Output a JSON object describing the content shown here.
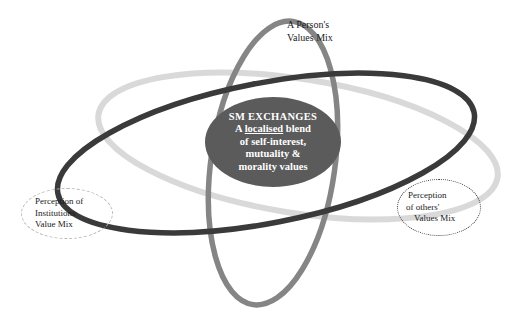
{
  "diagram": {
    "canvas": {
      "width": 520,
      "height": 319,
      "background": "#ffffff"
    },
    "core": {
      "name": "SM EXCHANGES",
      "heading": "SM EXCHANGES",
      "lines": [
        {
          "before": "A ",
          "underlined": "localised",
          "after": " blend"
        },
        {
          "before": "of self-interest,",
          "underlined": "",
          "after": ""
        },
        {
          "before": "mutuality &",
          "underlined": "",
          "after": ""
        },
        {
          "before": "morality values",
          "underlined": "",
          "after": ""
        }
      ],
      "fill": "#5b5b5b",
      "text_color": "#ffffff"
    },
    "labels": {
      "person": {
        "lines": [
          "A Person's",
          "Values Mix"
        ],
        "shape": "none"
      },
      "institutions": {
        "lines": [
          "Perception of",
          "Institutions",
          "Value Mix"
        ],
        "shape": "dashed-ellipse",
        "border_color": "#b4b4b4"
      },
      "others": {
        "lines": [
          "Perception",
          "of others'",
          "Values Mix"
        ],
        "shape": "dotted-ellipse",
        "border_color": "#3b3b3b"
      }
    },
    "orbits": [
      {
        "name": "dark-orbit",
        "color": "#3a3a3a",
        "stroke": 5.5,
        "rx": 212,
        "ry": 70,
        "cx": 266,
        "cy": 153,
        "rotation": -11
      },
      {
        "name": "light-orbit",
        "color": "#d9d9d9",
        "stroke": 6.0,
        "rx": 202,
        "ry": 67,
        "cx": 298,
        "cy": 146,
        "rotation": 9
      },
      {
        "name": "medium-orbit",
        "color": "#858585",
        "stroke": 5.5,
        "rx": 62,
        "ry": 143,
        "cx": 273,
        "cy": 163,
        "rotation": 8
      }
    ]
  }
}
